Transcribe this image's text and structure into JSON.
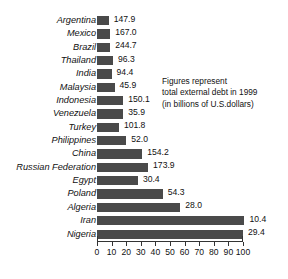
{
  "chart_data": {
    "type": "bar",
    "orientation": "horizontal",
    "title": "",
    "subtitle": "",
    "xlabel": "",
    "ylabel": "",
    "xlim": [
      0,
      100
    ],
    "grid": false,
    "legend": null,
    "annotations": [
      "Figures represent",
      "total external debt in 1999",
      "(in billions of U.S.dollars)"
    ],
    "xticks": [
      "0",
      "10",
      "20",
      "30",
      "40",
      "50",
      "60",
      "70",
      "80",
      "90",
      "100"
    ],
    "xtick_values": [
      0,
      10,
      20,
      30,
      40,
      50,
      60,
      70,
      80,
      90,
      100
    ],
    "categories": [
      "Argentina",
      "Mexico",
      "Brazil",
      "Thailand",
      "India",
      "Malaysia",
      "Indonesia",
      "Venezuela",
      "Turkey",
      "Philippines",
      "China",
      "Russian Federation",
      "Egypt",
      "Poland",
      "Algeria",
      "Iran",
      "Nigeria"
    ],
    "values": [
      8,
      9,
      9,
      11,
      10,
      12,
      18,
      18,
      15,
      20,
      31,
      35,
      28,
      45,
      57,
      101,
      100
    ],
    "data_labels": [
      "147.9",
      "167.0",
      "244.7",
      "96.3",
      "94.4",
      "45.9",
      "150.1",
      "35.9",
      "101.8",
      "52.0",
      "154.2",
      "173.9",
      "30.4",
      "54.3",
      "28.0",
      "10.4",
      "29.4"
    ],
    "bar_color": "#4a4a4a",
    "axis_color": "#333333"
  }
}
